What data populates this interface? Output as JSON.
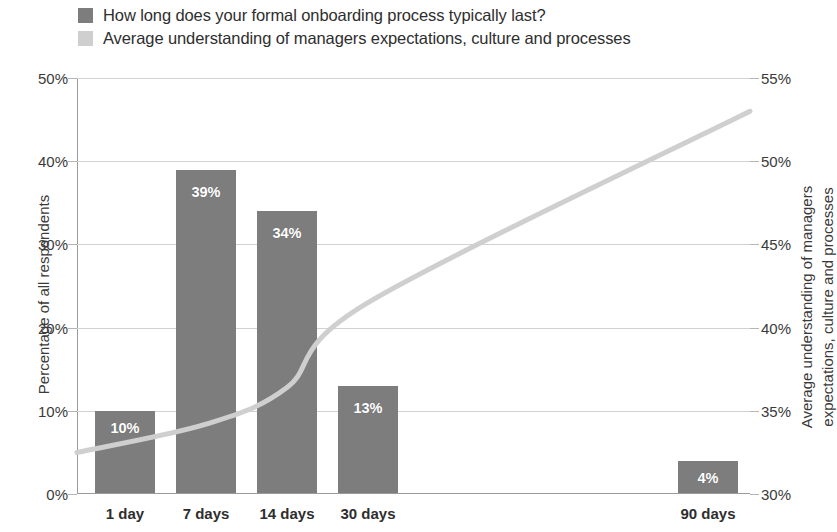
{
  "legend": {
    "items": [
      {
        "label": "How long does your formal onboarding process typically last?",
        "color": "#7d7d7d",
        "swatch": "dark-swatch"
      },
      {
        "label": "Average understanding of managers expectations, culture and processes",
        "color": "#cfcfcf",
        "swatch": "light-swatch"
      }
    ]
  },
  "axes": {
    "left_title": "Percentage of all respondents",
    "right_title": "Average understanding of managers expectations, culture and processes",
    "left_ticks": [
      "0%",
      "10%",
      "20%",
      "30%",
      "40%",
      "50%"
    ],
    "right_ticks": [
      "30%",
      "35%",
      "40%",
      "45%",
      "50%",
      "55%"
    ]
  },
  "chart_data": {
    "type": "bar",
    "title": "",
    "subtitle": "",
    "xlabel": "",
    "ylabel": "Percentage of all respondents",
    "categories": [
      "1 day",
      "7 days",
      "14 days",
      "30 days",
      "90 days"
    ],
    "x": [
      1,
      7,
      14,
      30,
      90
    ],
    "series": [
      {
        "name": "How long does your formal onboarding process typically last?",
        "type": "bar",
        "axis": "left",
        "color": "#7d7d7d",
        "values": [
          10,
          39,
          34,
          13,
          4
        ],
        "labels": [
          "10%",
          "39%",
          "34%",
          "13%",
          "4%"
        ]
      },
      {
        "name": "Average understanding of managers expectations, culture and processes",
        "type": "line",
        "axis": "right",
        "color": "#cfcfcf",
        "values": [
          32.5,
          34.2,
          36.4,
          41.5,
          53.0
        ]
      }
    ],
    "ylim": [
      0,
      50
    ],
    "y2lim": [
      30,
      55
    ],
    "ytick_step": 10,
    "y2tick_step": 5,
    "grid": true,
    "legend_position": "top-left"
  }
}
